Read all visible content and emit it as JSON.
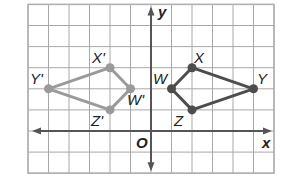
{
  "diagram": {
    "grid": {
      "x_min": -6,
      "x_max": 6,
      "y_min": -2,
      "y_max": 6,
      "origin_px": [
        151,
        131
      ],
      "cell_px": [
        20.5,
        21.1
      ],
      "line_color": "#a8a8a8",
      "border_color": "#b0b0b0"
    },
    "axes": {
      "x_label": "x",
      "y_label": "y",
      "origin_label": "O",
      "color": "#555555"
    },
    "original": {
      "name": "WXYZ",
      "color": "#4d4d4d",
      "vertices": [
        {
          "label": "W",
          "x": 1,
          "y": 2
        },
        {
          "label": "X",
          "x": 2,
          "y": 3
        },
        {
          "label": "Y",
          "x": 5,
          "y": 2
        },
        {
          "label": "Z",
          "x": 2,
          "y": 1
        }
      ]
    },
    "image": {
      "name": "W'X'Y'Z'",
      "color": "#9a9a9a",
      "vertices": [
        {
          "label": "W'",
          "x": -1,
          "y": 2
        },
        {
          "label": "X'",
          "x": -2,
          "y": 3
        },
        {
          "label": "Y'",
          "x": -5,
          "y": 2
        },
        {
          "label": "Z'",
          "x": -2,
          "y": 1
        }
      ]
    }
  }
}
